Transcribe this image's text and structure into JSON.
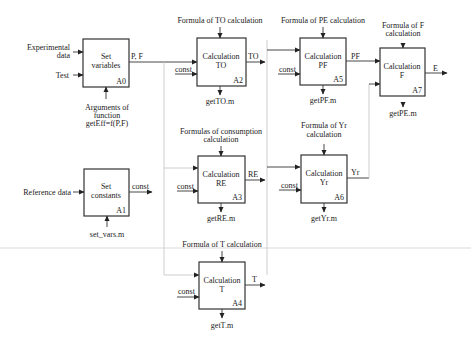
{
  "diagram": {
    "type": "IDEF0 functional block diagram",
    "blocks": [
      {
        "id": "A0",
        "title_line1": "Set",
        "title_line2": "variables",
        "code": "A0"
      },
      {
        "id": "A1",
        "title_line1": "Set",
        "title_line2": "constants",
        "code": "A1"
      },
      {
        "id": "A2",
        "title_line1": "Calculation",
        "title_line2": "TO",
        "code": "A2"
      },
      {
        "id": "A3",
        "title_line1": "Calculation",
        "title_line2": "RE",
        "code": "A3"
      },
      {
        "id": "A4",
        "title_line1": "Calculation",
        "title_line2": "T",
        "code": "A4"
      },
      {
        "id": "A5",
        "title_line1": "Calculation",
        "title_line2": "PF",
        "code": "A5"
      },
      {
        "id": "A6",
        "title_line1": "Calculation",
        "title_line2": "Yr",
        "code": "A6"
      },
      {
        "id": "A7",
        "title_line1": "Calculation",
        "title_line2": "F",
        "code": "A7"
      }
    ],
    "inputs": {
      "experimental_line1": "Experimental",
      "experimental_line2": "data",
      "test": "Test",
      "reference": "Reference data"
    },
    "controls": {
      "a2": "Formula of TO calculation",
      "a5": "Formula of PE calculation",
      "a7_line1": "Formula of F",
      "a7_line2": "calculation",
      "a3_line1": "Formulas of consumption",
      "a3_line2": "calculation",
      "a6_line1": "Formula of Yr",
      "a6_line2": "calculation",
      "a4": "Formula of T calculation"
    },
    "mechanisms": {
      "a0_line1": "Arguments of",
      "a0_line2": "function",
      "a0_line3": "getEff=f(P,F)",
      "a1": "set_vars.m",
      "a2": "getTO.m",
      "a3": "getRE.m",
      "a4": "getT.m",
      "a5": "getPF.m",
      "a6": "getYr.m",
      "a7": "getPE.m"
    },
    "outputs": {
      "a0": "P, F",
      "a1": "const",
      "a2": "TO",
      "a3": "RE",
      "a4": "T",
      "a5": "PF",
      "a6": "Yr",
      "a7": "E"
    },
    "const_label": "const"
  }
}
